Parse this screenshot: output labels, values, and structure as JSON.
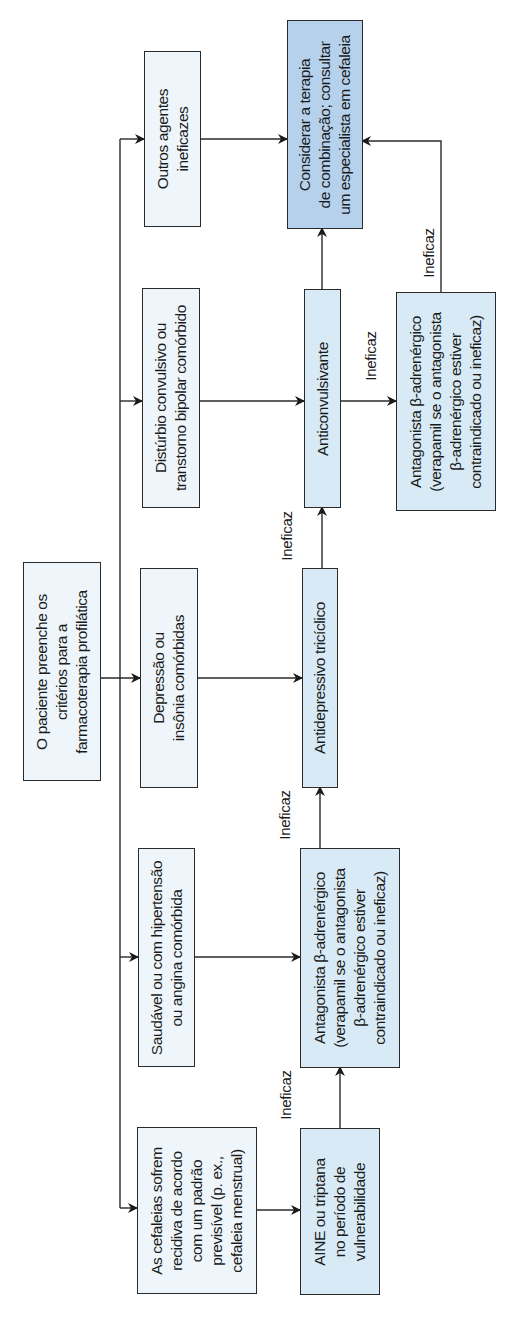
{
  "diagram": {
    "orientation": "rotated-90-ccw",
    "colors": {
      "line": "#2a2a2a",
      "fill_pale": "#eef6fb",
      "fill_light": "#d7eaf5",
      "fill_highlight": "#b5d1ec"
    },
    "start": {
      "text": "O paciente preenche os\ncritérios para a\nfarmacoterapia profilática"
    },
    "conditions": [
      {
        "id": "cond-pattern",
        "text": "As cefaleias sofrem\nrecidiva de acordo\ncom um padrão\nprevisível (p. ex.,\ncefaleia menstrual)"
      },
      {
        "id": "cond-healthy",
        "text": "Saudável ou com hipertensão\nou angina comórbida"
      },
      {
        "id": "cond-depression",
        "text": "Depressão ou\ninsônia comórbidas"
      },
      {
        "id": "cond-seizure",
        "text": "Distúrbio convulsivo ou\ntranstorno bipolar comórbido"
      },
      {
        "id": "cond-other",
        "text": "Outros agentes\nineficazes"
      }
    ],
    "treatments": [
      {
        "id": "tx-aine",
        "text": "AINE ou triptana\nno período de\nvulnerabilidade"
      },
      {
        "id": "tx-beta-1",
        "text": "Antagonista β-adrenérgico\n(verapamil se o antagonista\nβ-adrenérgico estiver\ncontraindicado ou ineficaz)"
      },
      {
        "id": "tx-tricyclic",
        "text": "Antidepressivo tricíclico"
      },
      {
        "id": "tx-anticonvulsant",
        "text": "Anticonvulsivante"
      },
      {
        "id": "tx-beta-2",
        "text": "Antagonista β-adrenérgico\n(verapamil se o antagonista\nβ-adrenérgico estiver\ncontraindicado ou ineficaz)"
      }
    ],
    "final": {
      "text": "Considerar a terapia\nde combinação; consultar\num especialista em cefaleia"
    },
    "edge_labels": {
      "aine_to_beta": "Ineficaz",
      "beta_to_tricyclic": "Ineficaz",
      "tricyclic_to_anticonvulsant": "Ineficaz",
      "anticonvulsant_to_beta": "Ineficaz",
      "beta_to_final": "Ineficaz"
    }
  }
}
